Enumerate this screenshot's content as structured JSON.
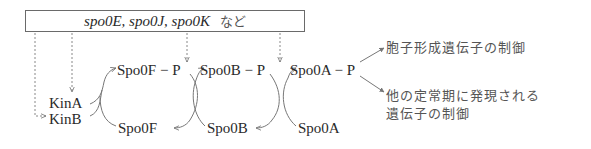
{
  "header_box": {
    "genes": "spo0E, spo0J, spo0K",
    "suffix": "など"
  },
  "nodes": {
    "spo0f_p": "Spo0F − P",
    "spo0b_p": "Spo0B − P",
    "spo0a_p": "Spo0A − P",
    "spo0f": "Spo0F",
    "spo0b": "Spo0B",
    "spo0a": "Spo0A",
    "kina": "KinA",
    "kinb": "KinB"
  },
  "outputs": {
    "sporulation": "胞子形成遺伝子の制御",
    "stationary_line1": "他の定常期に発現される",
    "stationary_line2": "遺伝子の制御"
  },
  "colors": {
    "line": "#777777",
    "text": "#2a2a2a"
  }
}
